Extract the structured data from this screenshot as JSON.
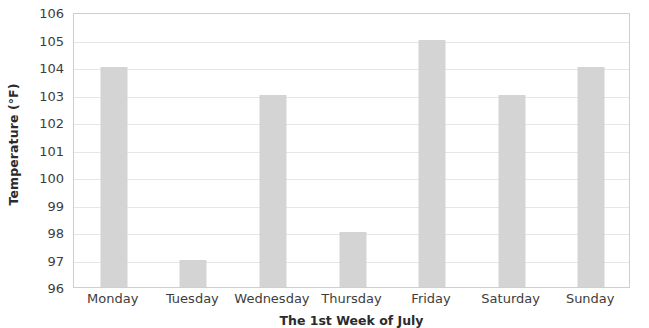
{
  "chart_data": {
    "type": "bar",
    "title": "",
    "xlabel": "The 1st Week of July",
    "ylabel": "Temperature (°F)",
    "categories": [
      "Monday",
      "Tuesday",
      "Wednesday",
      "Thursday",
      "Friday",
      "Saturday",
      "Sunday"
    ],
    "values": [
      104,
      97,
      103,
      98,
      105,
      103,
      104
    ],
    "ylim": [
      96,
      106
    ],
    "ytick_labels": [
      "106",
      "105",
      "104",
      "103",
      "102",
      "101",
      "100",
      "99",
      "98",
      "97",
      "96"
    ],
    "ytick_values": [
      106,
      105,
      104,
      103,
      102,
      101,
      100,
      99,
      98,
      97,
      96
    ],
    "ytick_step": 1,
    "grid": true,
    "grid_axis": "y",
    "legend": false,
    "legend_position": "none",
    "bar_color": "#d4d4d4",
    "gridline_color": "#e6e6e6",
    "plot_border_color": "#cfcfcf",
    "text_color": "#3d3d3d",
    "background_color": "#ffffff"
  }
}
